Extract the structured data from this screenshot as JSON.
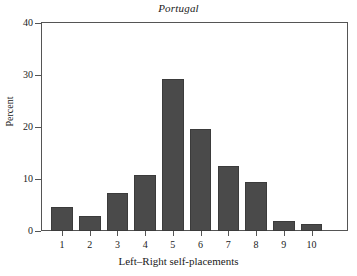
{
  "chart_data": {
    "type": "bar",
    "title": "Portugal",
    "xlabel": "Left–Right self-placements",
    "ylabel": "Percent",
    "categories": [
      "1",
      "2",
      "3",
      "4",
      "5",
      "6",
      "7",
      "8",
      "9",
      "10"
    ],
    "values": [
      4.6,
      2.9,
      7.3,
      10.8,
      29.3,
      19.7,
      12.5,
      9.5,
      1.9,
      1.3
    ],
    "ylim": [
      0,
      40
    ],
    "yticks": [
      0,
      10,
      20,
      30,
      40
    ],
    "ytick_labels": [
      "0",
      "10",
      "20",
      "30",
      "40"
    ],
    "grid": false,
    "legend": false,
    "bar_color": "#4a4a4a",
    "axis_color": "#555555",
    "background": "#ffffff"
  }
}
